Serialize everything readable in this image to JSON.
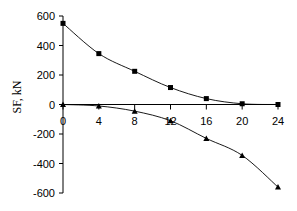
{
  "chart_data": {
    "type": "line",
    "title": "",
    "xlabel": "",
    "ylabel": "SF, kN",
    "x": [
      0,
      4,
      8,
      12,
      16,
      20,
      24
    ],
    "xlim": [
      0,
      24
    ],
    "ylim": [
      -600,
      600
    ],
    "x_ticks": [
      0,
      4,
      8,
      12,
      16,
      20,
      24
    ],
    "y_ticks": [
      600,
      400,
      200,
      0,
      -200,
      -400,
      -600
    ],
    "grid": false,
    "legend": null,
    "series": [
      {
        "name": "Series 1 (squares)",
        "marker": "square",
        "values": [
          550,
          345,
          225,
          115,
          40,
          5,
          0
        ]
      },
      {
        "name": "Series 2 (triangles)",
        "marker": "triangle",
        "values": [
          0,
          -10,
          -45,
          -110,
          -230,
          -345,
          -560
        ]
      }
    ]
  },
  "colors": {
    "line": "#000000",
    "axis": "#000000",
    "background": "#ffffff"
  }
}
